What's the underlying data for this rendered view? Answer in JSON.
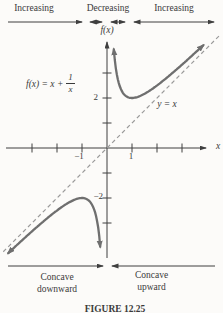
{
  "colors": {
    "ink": "#3a3a3a",
    "axis": "#3f3f3f",
    "curve": "#6f6f6f",
    "dashed": "#9a9a9a",
    "background": "#fcfbf9"
  },
  "figure": {
    "caption": "FIGURE 12.25",
    "top_ruler": {
      "labels": [
        "Increasing",
        "Decreasing",
        "Increasing"
      ]
    },
    "bottom_ruler": {
      "left_label": [
        "Concave",
        "downward"
      ],
      "right_label": [
        "Concave",
        "upward"
      ]
    },
    "graph": {
      "y_axis_label": "f(x)",
      "x_axis_label": "x",
      "formula": {
        "prefix": "f(x) = x +",
        "numerator": "1",
        "denominator": "x"
      },
      "asymptote_label": "y = x",
      "tick_labels": {
        "x_neg1": "−1",
        "x_pos1": "1",
        "y_pos2": "2",
        "y_neg2": "−2"
      }
    }
  },
  "chart_data": {
    "type": "line",
    "title": "",
    "function": "f(x) = x + 1/x",
    "xlabel": "x",
    "ylabel": "f(x)",
    "xlim": [
      -4.2,
      4.7
    ],
    "ylim": [
      -4.4,
      4.4
    ],
    "x_ticks": [
      -3,
      -2,
      -1,
      1,
      2,
      3
    ],
    "y_ticks": [
      -3,
      -2,
      -1,
      1,
      2,
      3
    ],
    "x_ticks_labeled": [
      -1,
      1
    ],
    "y_ticks_labeled": [
      2,
      -2
    ],
    "grid": false,
    "branches": [
      {
        "name": "x < 0",
        "x_range": [
          -3.95,
          -0.272
        ]
      },
      {
        "name": "x > 0",
        "x_range": [
          0.272,
          3.85
        ]
      }
    ],
    "key_points": {
      "local_max": [
        -1,
        -2
      ],
      "local_min": [
        1,
        2
      ]
    },
    "asymptote": {
      "label": "y = x",
      "slope": 1,
      "intercept": 0,
      "x_range": [
        -4.15,
        4.55
      ]
    },
    "increasing_intervals": [
      "(-inf, -1)",
      "(1, inf)"
    ],
    "decreasing_intervals": [
      "(-1, 0)",
      "(0, 1)"
    ],
    "concave_downward": "(-inf, 0)",
    "concave_upward": "(0, inf)"
  }
}
